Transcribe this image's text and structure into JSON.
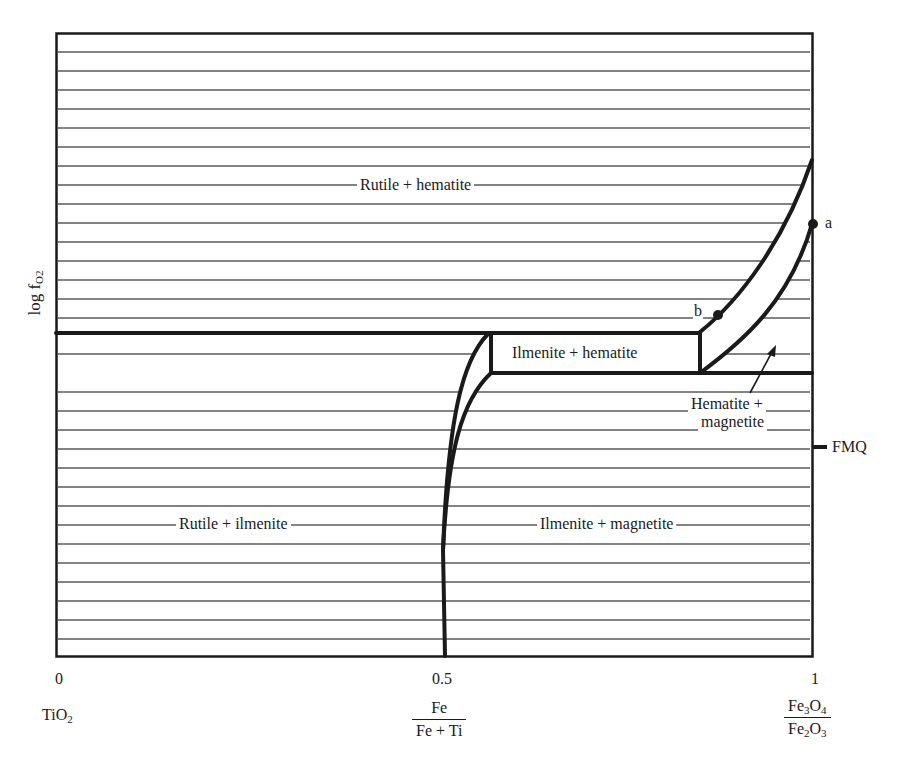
{
  "diagram": {
    "type": "phase-diagram",
    "y_axis": {
      "label": "log f",
      "label_subscript": "O2"
    },
    "x_axis": {
      "ticks": [
        {
          "value": "0",
          "x": 60
        },
        {
          "value": "0.5",
          "x": 445
        },
        {
          "value": "1",
          "x": 813
        }
      ],
      "end_label_left": {
        "text": "TiO",
        "sub": "2"
      },
      "center_label": {
        "numerator": "Fe",
        "denominator": "Fe + Ti"
      },
      "end_label_right": {
        "numerator": {
          "a": "Fe",
          "a_sub": "3",
          "b": "O",
          "b_sub": "4"
        },
        "denominator": {
          "a": "Fe",
          "a_sub": "2",
          "b": "O",
          "b_sub": "3"
        }
      }
    },
    "fields": [
      {
        "id": "rutile-hematite",
        "label": "Rutile + hematite"
      },
      {
        "id": "ilmenite-hematite",
        "label": "Ilmenite + hematite"
      },
      {
        "id": "hematite-magnetite",
        "label_line1": "Hematite +",
        "label_line2": "magnetite"
      },
      {
        "id": "rutile-ilmenite",
        "label": "Rutile + ilmenite"
      },
      {
        "id": "ilmenite-magnetite",
        "label": "Ilmenite + magnetite"
      }
    ],
    "points": [
      {
        "id": "a",
        "label": "a"
      },
      {
        "id": "b",
        "label": "b"
      }
    ],
    "buffer": {
      "label": "FMQ"
    },
    "colors": {
      "line": "#1a1a1a",
      "hatch": "#555555",
      "background": "#ffffff"
    }
  }
}
